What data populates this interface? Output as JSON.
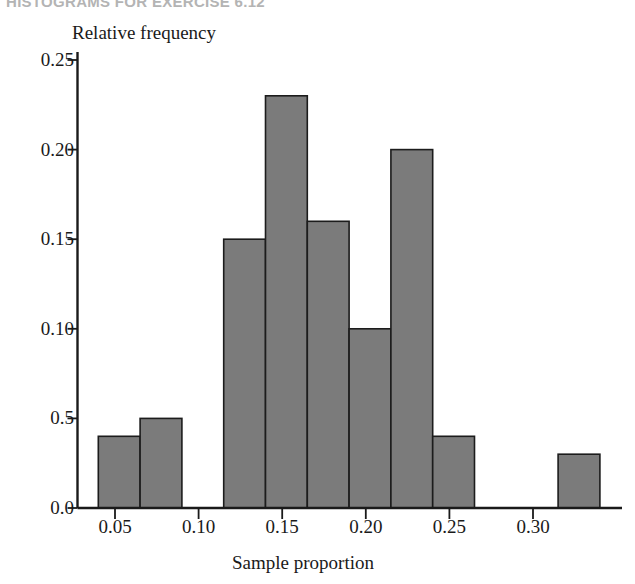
{
  "figure": {
    "title": "HISTOGRAMS FOR EXERCISE 6.12",
    "ylabel": "Relative frequency",
    "xlabel": "Sample proportion"
  },
  "chart_data": {
    "type": "bar",
    "title": "HISTOGRAMS FOR EXERCISE 6.12",
    "xlabel": "Sample proportion",
    "ylabel": "Relative frequency",
    "grid": false,
    "legend": "none",
    "xlim": [
      0.03,
      0.34
    ],
    "ylim": [
      0.0,
      0.25
    ],
    "bin_width": 0.025,
    "xticks": [
      0.05,
      0.1,
      0.15,
      0.2,
      0.25,
      0.3
    ],
    "xtick_labels": [
      "0.05",
      "0.10",
      "0.15",
      "0.20",
      "0.25",
      "0.30"
    ],
    "yticks": [
      0.0,
      0.05,
      0.1,
      0.15,
      0.2,
      0.25
    ],
    "ytick_labels": [
      "0.0",
      "0.5",
      "0.10",
      "0.15",
      "0.20",
      "0.25"
    ],
    "categories": [
      "0.040-0.065",
      "0.065-0.090",
      "0.115-0.140",
      "0.140-0.165",
      "0.165-0.190",
      "0.190-0.215",
      "0.215-0.240",
      "0.240-0.265",
      "0.315-0.340"
    ],
    "bin_starts": [
      0.04,
      0.065,
      0.115,
      0.14,
      0.165,
      0.19,
      0.215,
      0.24,
      0.315
    ],
    "bin_ends": [
      0.065,
      0.09,
      0.14,
      0.165,
      0.19,
      0.215,
      0.24,
      0.265,
      0.34
    ],
    "values": [
      0.04,
      0.05,
      0.15,
      0.23,
      0.16,
      0.1,
      0.2,
      0.04,
      0.03
    ],
    "bar_color": "#7b7b7b",
    "bar_edge_color": "#1c1c1c",
    "background": "#ffffff"
  }
}
